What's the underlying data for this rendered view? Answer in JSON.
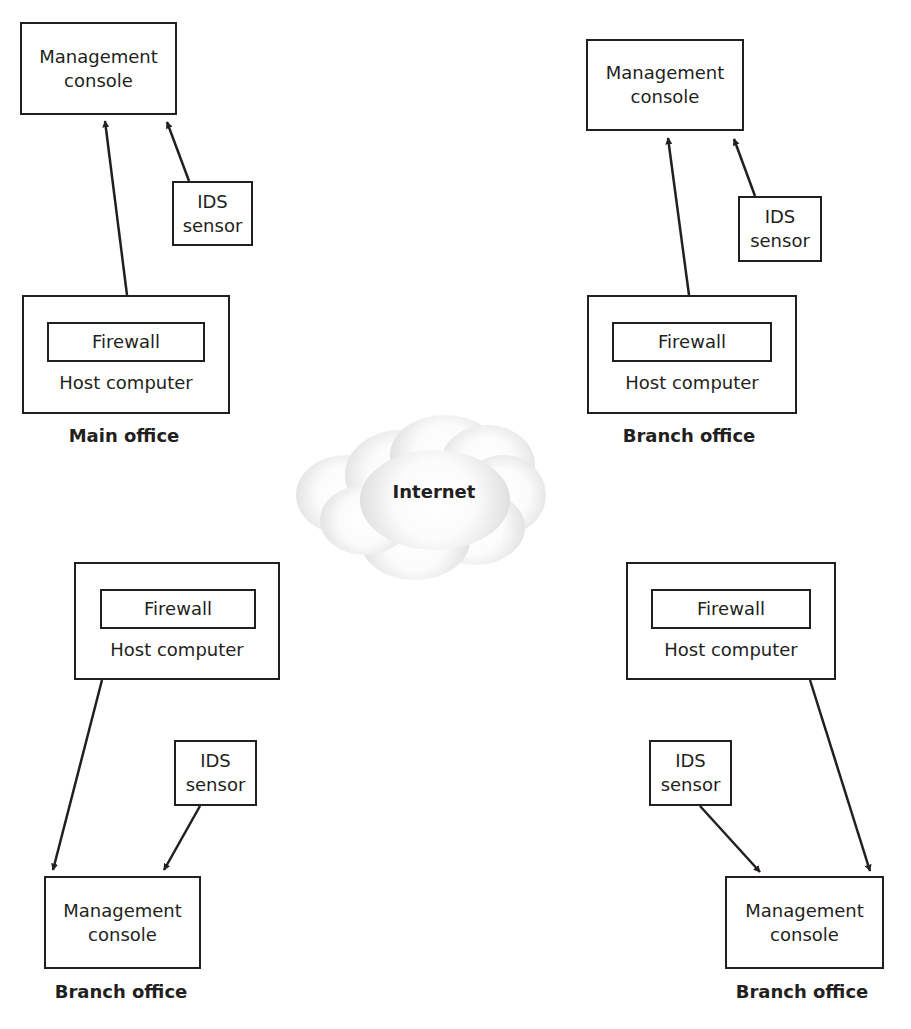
{
  "diagram": {
    "type": "network-topology",
    "center": {
      "label": "Internet",
      "icon": "cloud-icon"
    },
    "sites": [
      {
        "id": "top-left",
        "label": "Main office",
        "management_console": {
          "line1": "Management",
          "line2": "console"
        },
        "ids_sensor": {
          "line1": "IDS",
          "line2": "sensor"
        },
        "host": {
          "firewall": "Firewall",
          "label": "Host computer"
        }
      },
      {
        "id": "top-right",
        "label": "Branch office",
        "management_console": {
          "line1": "Management",
          "line2": "console"
        },
        "ids_sensor": {
          "line1": "IDS",
          "line2": "sensor"
        },
        "host": {
          "firewall": "Firewall",
          "label": "Host computer"
        }
      },
      {
        "id": "bottom-left",
        "label": "Branch office",
        "management_console": {
          "line1": "Management",
          "line2": "console"
        },
        "ids_sensor": {
          "line1": "IDS",
          "line2": "sensor"
        },
        "host": {
          "firewall": "Firewall",
          "label": "Host computer"
        }
      },
      {
        "id": "bottom-right",
        "label": "Branch office",
        "management_console": {
          "line1": "Management",
          "line2": "console"
        },
        "ids_sensor": {
          "line1": "IDS",
          "line2": "sensor"
        },
        "host": {
          "firewall": "Firewall",
          "label": "Host computer"
        }
      }
    ],
    "edges": [
      {
        "site": "top-left",
        "from": "host",
        "to": "management_console"
      },
      {
        "site": "top-left",
        "from": "ids_sensor",
        "to": "management_console"
      },
      {
        "site": "top-right",
        "from": "host",
        "to": "management_console"
      },
      {
        "site": "top-right",
        "from": "ids_sensor",
        "to": "management_console"
      },
      {
        "site": "bottom-left",
        "from": "host",
        "to": "management_console"
      },
      {
        "site": "bottom-left",
        "from": "ids_sensor",
        "to": "management_console"
      },
      {
        "site": "bottom-right",
        "from": "host",
        "to": "management_console"
      },
      {
        "site": "bottom-right",
        "from": "ids_sensor",
        "to": "management_console"
      }
    ],
    "colors": {
      "line": "#231f20",
      "cloud_edge": "#cfcfcf",
      "background": "#ffffff"
    }
  }
}
